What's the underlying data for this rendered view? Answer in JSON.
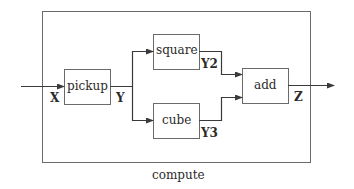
{
  "diagram": {
    "caption": "compute",
    "blocks": [
      {
        "id": "pickup",
        "label": "pickup"
      },
      {
        "id": "square",
        "label": "square"
      },
      {
        "id": "cube",
        "label": "cube"
      },
      {
        "id": "add",
        "label": "add"
      }
    ],
    "signals": {
      "input": "X",
      "pickup_out": "Y",
      "square_out": "Y2",
      "cube_out": "Y3",
      "output": "Z"
    },
    "edges": [
      {
        "from": "input",
        "to": "pickup",
        "signal": "X"
      },
      {
        "from": "pickup",
        "to": "square",
        "signal": "Y"
      },
      {
        "from": "pickup",
        "to": "cube",
        "signal": "Y"
      },
      {
        "from": "square",
        "to": "add",
        "signal": "Y2"
      },
      {
        "from": "cube",
        "to": "add",
        "signal": "Y3"
      },
      {
        "from": "add",
        "to": "output",
        "signal": "Z"
      }
    ],
    "colors": {
      "line": "#3a3a3a",
      "box_border": "#6a6a6a",
      "text": "#2a2a2a",
      "background": "#ffffff"
    }
  }
}
